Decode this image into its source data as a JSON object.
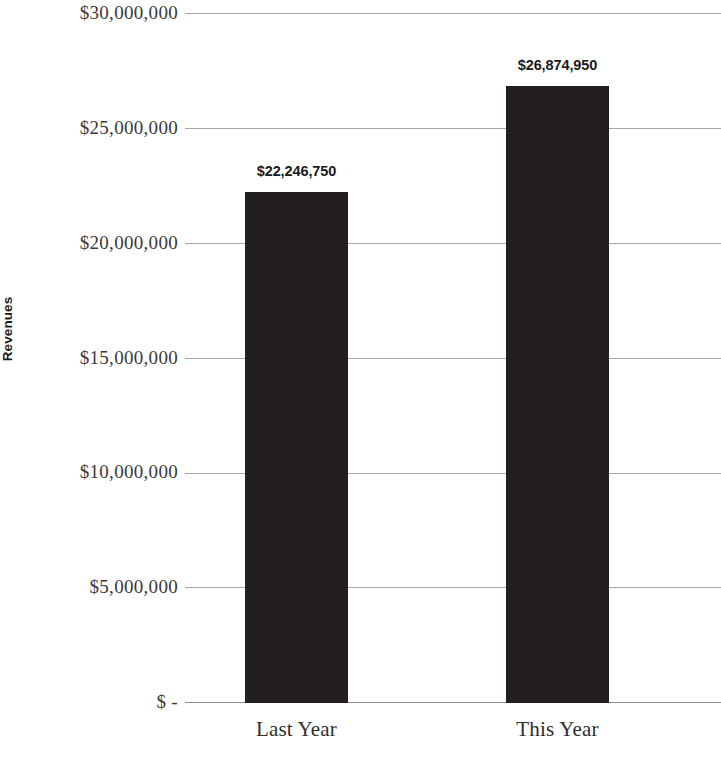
{
  "chart_data": {
    "type": "bar",
    "title": "",
    "subtitle": "",
    "xlabel": "",
    "ylabel": "Revenues",
    "categories": [
      "Last Year",
      "This Year"
    ],
    "values": [
      22246750,
      26874950
    ],
    "value_labels": [
      "$22,246,750",
      "$26,874,950"
    ],
    "ylim": [
      0,
      30000000
    ],
    "ytick_values": [
      0,
      5000000,
      10000000,
      15000000,
      20000000,
      25000000,
      30000000
    ],
    "ytick_labels": [
      "$ -",
      "$5,000,000",
      "$10,000,000",
      "$15,000,000",
      "$20,000,000",
      "$25,000,000",
      "$30,000,000"
    ],
    "grid": true,
    "legend": false,
    "legend_position": "none",
    "bar_color": "#231f20",
    "gridline_color": "#a8a8a8",
    "background_color": "#ffffff",
    "series": [
      {
        "name": "Revenues",
        "values": [
          22246750,
          26874950
        ]
      }
    ]
  }
}
